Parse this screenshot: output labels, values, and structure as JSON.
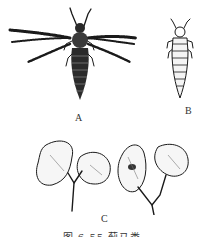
{
  "figure": {
    "panels": [
      {
        "id": "A",
        "label": "A",
        "subject": "winged adult thrips, dorsal view with fringed wings spread"
      },
      {
        "id": "B",
        "label": "B",
        "subject": "wingless nymph thrips, dorsal view"
      },
      {
        "id": "C",
        "label": "C",
        "subject": "damaged seedling cotyledons, two seedlings"
      }
    ],
    "caption": "图 6-55  蓟马类"
  },
  "colors": {
    "background": "#ffffff",
    "ink": "#1a1a1a"
  }
}
